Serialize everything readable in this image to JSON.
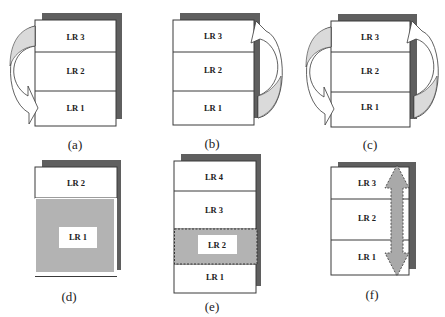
{
  "figure": {
    "panels": [
      {
        "id": "a",
        "caption": "(a)",
        "layers": [
          "LR 3",
          "LR 2",
          "LR 1"
        ],
        "arrows": [
          {
            "icon": "curved-arrow-left-icon",
            "from": "LR 3",
            "to": "LR 1",
            "side": "left"
          }
        ]
      },
      {
        "id": "b",
        "caption": "(b)",
        "layers": [
          "LR 3",
          "LR 2",
          "LR 1"
        ],
        "arrows": [
          {
            "icon": "curved-arrow-right-icon",
            "from": "LR 1",
            "to": "LR 3",
            "side": "right"
          }
        ]
      },
      {
        "id": "c",
        "caption": "(c)",
        "layers": [
          "LR 3",
          "LR 2",
          "LR 1"
        ],
        "arrows": [
          {
            "icon": "curved-arrow-left-icon",
            "from": "LR 3",
            "to": "LR 1",
            "side": "left"
          },
          {
            "icon": "curved-arrow-right-icon",
            "from": "LR 1",
            "to": "LR 3",
            "side": "right"
          }
        ]
      },
      {
        "id": "d",
        "caption": "(d)",
        "layers": [
          "LR 2",
          "LR 1"
        ],
        "highlight": "LR 1 expanded (shaded)"
      },
      {
        "id": "e",
        "caption": "(e)",
        "layers": [
          "LR 4",
          "LR 3",
          "LR 2",
          "LR 1"
        ],
        "highlight": "LR 2 shaded with dashed border"
      },
      {
        "id": "f",
        "caption": "(f)",
        "layers": [
          "LR 3",
          "LR 2",
          "LR 1"
        ],
        "arrows": [
          {
            "icon": "double-headed-arrow-icon",
            "from": "LR 1",
            "to": "LR 3",
            "side": "right",
            "style": "dashed"
          }
        ]
      }
    ]
  },
  "colors": {
    "shadow": "#5f5f5f",
    "shaded_region": "#b3b3b3",
    "arrow_back_face": "#dadada",
    "outline": "#3a3a3a",
    "background": "#ffffff"
  }
}
